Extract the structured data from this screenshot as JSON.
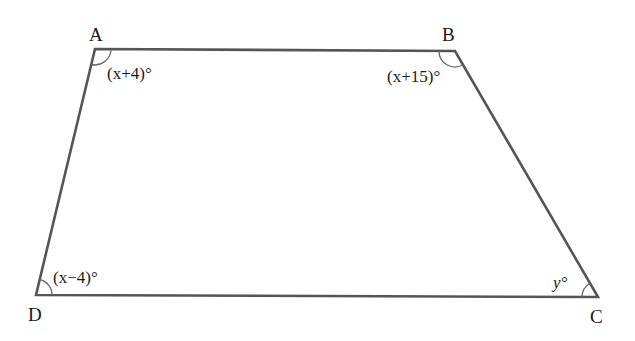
{
  "diagram": {
    "type": "quadrilateral",
    "vertices": {
      "A": {
        "label": "A",
        "x": 95,
        "y": 49
      },
      "B": {
        "label": "B",
        "x": 455,
        "y": 51
      },
      "C": {
        "label": "C",
        "x": 598,
        "y": 297
      },
      "D": {
        "label": "D",
        "x": 36,
        "y": 295
      }
    },
    "angles": {
      "A": {
        "label": "(x+4)°",
        "var": "x",
        "offset": "+4"
      },
      "B": {
        "label": "(x+15)°",
        "var": "x",
        "offset": "+15"
      },
      "C": {
        "label": "y°",
        "var": "y"
      },
      "D": {
        "label": "(x−4)°",
        "var": "x",
        "offset": "−4"
      }
    },
    "colors": {
      "edge": "#555555",
      "arc": "#666666",
      "text": "#1a1a1a",
      "background": "#ffffff"
    }
  }
}
